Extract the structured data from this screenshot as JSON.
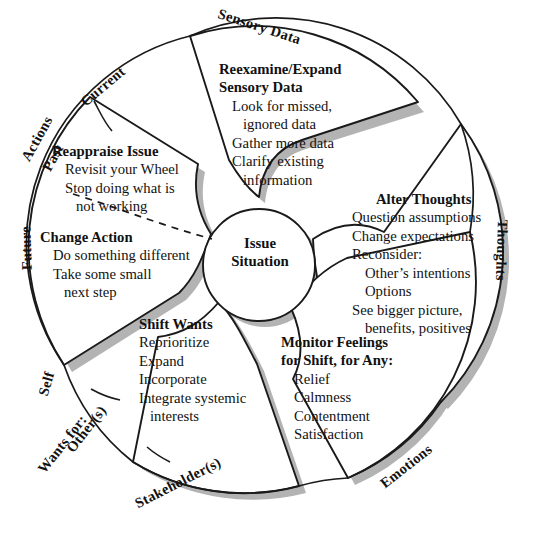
{
  "diagram": {
    "title_hub": {
      "line1": "Issue",
      "line2": "Situation"
    },
    "colors": {
      "stroke": "#1a1a1a",
      "shadow": "#b3b3b3",
      "fill": "#ffffff",
      "text": "#111111"
    },
    "ring_labels": [
      {
        "id": "sensory-data",
        "text": "Sensory Data"
      },
      {
        "id": "thoughts",
        "text": "Thoughts"
      },
      {
        "id": "emotions",
        "text": "Emotions"
      },
      {
        "id": "stakeholders",
        "text": "Stakeholder(s)"
      },
      {
        "id": "wants-for",
        "text": "Wants for:"
      },
      {
        "id": "others",
        "text": "Other(s)"
      },
      {
        "id": "self",
        "text": "Self"
      },
      {
        "id": "future",
        "text": "Future"
      },
      {
        "id": "past",
        "text": "Past"
      },
      {
        "id": "actions",
        "text": "Actions"
      },
      {
        "id": "current",
        "text": "Current"
      }
    ],
    "petals": [
      {
        "id": "reexamine-expand-sensory-data",
        "heading": [
          "Reexamine/Expand",
          "Sensory Data"
        ],
        "items": [
          "Look for missed,",
          "ignored data",
          "Gather more data",
          "Clarify existing",
          "information"
        ],
        "item_indent": [
          1,
          2,
          1,
          1,
          2
        ]
      },
      {
        "id": "alter-thoughts",
        "heading": [
          "Alter Thoughts"
        ],
        "items": [
          "Question assumptions",
          "Change expectations",
          "Reconsider:",
          "Other’s intentions",
          "Options",
          "See bigger picture,",
          "benefits, positives"
        ],
        "item_indent": [
          0,
          0,
          0,
          1,
          1,
          0,
          1
        ]
      },
      {
        "id": "monitor-feelings",
        "heading": [
          "Monitor Feelings",
          "for Shift, for Any:"
        ],
        "items": [
          "Relief",
          "Calmness",
          "Contentment",
          "Satisfaction"
        ],
        "item_indent": [
          1,
          1,
          1,
          1
        ]
      },
      {
        "id": "shift-wants",
        "heading": [
          "Shift Wants"
        ],
        "items": [
          "Reprioritize",
          "Expand",
          "Incorporate",
          "Integrate systemic",
          "interests"
        ],
        "item_indent": [
          1,
          1,
          1,
          1,
          2
        ]
      },
      {
        "id": "reappraise-issue",
        "heading": [
          "Reappraise Issue"
        ],
        "items": [
          "Revisit your Wheel",
          "Stop doing what is",
          "not working"
        ],
        "item_indent": [
          1,
          1,
          2
        ]
      },
      {
        "id": "change-action",
        "heading": [
          "Change Action"
        ],
        "items": [
          "Do something different",
          "Take some small",
          "next step"
        ],
        "item_indent": [
          1,
          1,
          2
        ]
      }
    ]
  }
}
